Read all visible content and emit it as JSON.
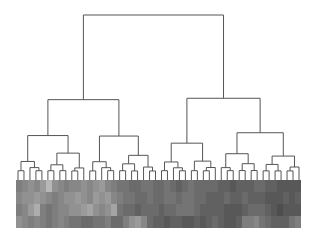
{
  "chart_data": {
    "type": "heatmap",
    "title": "",
    "xlabel": "",
    "ylabel": "",
    "legend": "none",
    "grid": false,
    "dendrogram": {
      "orientation": "top",
      "n_leaves": 48,
      "line_color": "#555555",
      "leaf_x_range": [
        18,
        299
      ],
      "baseline_y": 180,
      "root_y": 15
    },
    "heatmap": {
      "rows": 4,
      "cols": 48,
      "colormap": "grayscale",
      "value_range": [
        0,
        1
      ],
      "values": [
        [
          0.45,
          0.5,
          0.55,
          0.5,
          0.6,
          0.75,
          0.55,
          0.5,
          0.45,
          0.5,
          0.5,
          0.55,
          0.5,
          0.55,
          0.6,
          0.5,
          0.45,
          0.4,
          0.4,
          0.35,
          0.35,
          0.4,
          0.4,
          0.35,
          0.35,
          0.4,
          0.35,
          0.3,
          0.35,
          0.4,
          0.35,
          0.35,
          0.35,
          0.35,
          0.3,
          0.3,
          0.25,
          0.3,
          0.3,
          0.3,
          0.35,
          0.35,
          0.3,
          0.3,
          0.25,
          0.25,
          0.25,
          0.25
        ],
        [
          0.5,
          0.55,
          0.55,
          0.6,
          0.55,
          0.5,
          0.45,
          0.5,
          0.55,
          0.55,
          0.6,
          0.55,
          0.5,
          0.6,
          0.55,
          0.6,
          0.5,
          0.45,
          0.4,
          0.4,
          0.35,
          0.35,
          0.4,
          0.35,
          0.35,
          0.4,
          0.4,
          0.35,
          0.4,
          0.4,
          0.35,
          0.35,
          0.3,
          0.3,
          0.3,
          0.35,
          0.3,
          0.3,
          0.35,
          0.3,
          0.3,
          0.3,
          0.25,
          0.25,
          0.25,
          0.3,
          0.25,
          0.3
        ],
        [
          0.45,
          0.5,
          0.6,
          0.7,
          0.45,
          0.4,
          0.45,
          0.5,
          0.5,
          0.55,
          0.55,
          0.6,
          0.65,
          0.55,
          0.5,
          0.55,
          0.65,
          0.4,
          0.35,
          0.35,
          0.3,
          0.35,
          0.35,
          0.35,
          0.3,
          0.35,
          0.35,
          0.4,
          0.4,
          0.4,
          0.35,
          0.3,
          0.3,
          0.3,
          0.3,
          0.25,
          0.25,
          0.25,
          0.3,
          0.35,
          0.35,
          0.35,
          0.3,
          0.25,
          0.2,
          0.25,
          0.25,
          0.25
        ],
        [
          0.55,
          0.5,
          0.45,
          0.5,
          0.45,
          0.4,
          0.45,
          0.5,
          0.45,
          0.4,
          0.4,
          0.35,
          0.35,
          0.4,
          0.4,
          0.45,
          0.35,
          0.35,
          0.45,
          0.55,
          0.6,
          0.5,
          0.35,
          0.3,
          0.3,
          0.25,
          0.3,
          0.3,
          0.25,
          0.25,
          0.3,
          0.25,
          0.3,
          0.35,
          0.3,
          0.25,
          0.25,
          0.3,
          0.45,
          0.45,
          0.5,
          0.4,
          0.35,
          0.3,
          0.3,
          0.3,
          0.4,
          0.45
        ]
      ]
    }
  }
}
